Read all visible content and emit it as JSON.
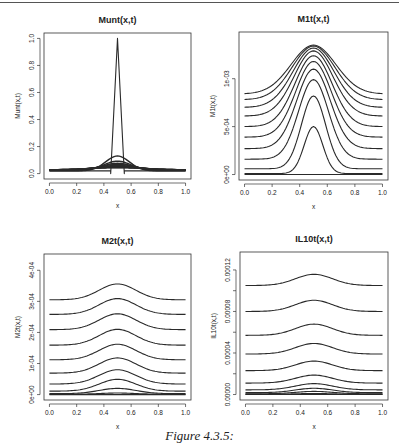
{
  "figure": {
    "caption": "Figure 4.3.5:"
  },
  "chart_data": [
    {
      "type": "line",
      "id": "munt",
      "title": "Munt(x,t)",
      "xlabel": "x",
      "ylabel": "Munt(x,t)",
      "xlim": [
        0,
        1
      ],
      "ylim": [
        0,
        1.0
      ],
      "xticks": [
        "0.0",
        "0.2",
        "0.4",
        "0.6",
        "0.8",
        "1.0"
      ],
      "yticks": [
        {
          "value": 0.0,
          "label": "0.0"
        },
        {
          "value": 0.2,
          "label": "0.2"
        },
        {
          "value": 0.4,
          "label": "0.4"
        },
        {
          "value": 0.6,
          "label": "0.6"
        },
        {
          "value": 0.8,
          "label": "0.8"
        },
        {
          "value": 1.0,
          "label": "1.0"
        }
      ],
      "grid": false,
      "initial_condition": {
        "shape": "spike",
        "peak_x": 0.5,
        "peak_y": 1.0,
        "support": [
          0.45,
          0.55
        ],
        "base": 0.02
      },
      "series": [
        {
          "name": "t1",
          "baseline": 0.02,
          "amplitude": 0.11,
          "width": 0.13
        },
        {
          "name": "t2",
          "baseline": 0.022,
          "amplitude": 0.07,
          "width": 0.15
        },
        {
          "name": "t3",
          "baseline": 0.024,
          "amplitude": 0.052,
          "width": 0.17
        },
        {
          "name": "t4",
          "baseline": 0.025,
          "amplitude": 0.042,
          "width": 0.19
        },
        {
          "name": "t5",
          "baseline": 0.026,
          "amplitude": 0.034,
          "width": 0.21
        },
        {
          "name": "t6",
          "baseline": 0.027,
          "amplitude": 0.028,
          "width": 0.23
        },
        {
          "name": "t7",
          "baseline": 0.027,
          "amplitude": 0.024,
          "width": 0.25
        },
        {
          "name": "t8",
          "baseline": 0.028,
          "amplitude": 0.02,
          "width": 0.27
        },
        {
          "name": "t9",
          "baseline": 0.028,
          "amplitude": 0.017,
          "width": 0.29
        },
        {
          "name": "t10",
          "baseline": 0.028,
          "amplitude": 0.015,
          "width": 0.31
        }
      ]
    },
    {
      "type": "line",
      "id": "m1t",
      "title": "M1t(x,t)",
      "xlabel": "x",
      "ylabel": "M1t(x,t)",
      "xlim": [
        0,
        1
      ],
      "ylim": [
        0,
        0.00143
      ],
      "xticks": [
        "0.0",
        "0.2",
        "0.4",
        "0.6",
        "0.8",
        "1.0"
      ],
      "yticks": [
        {
          "value": 0.0,
          "label": "0e+00"
        },
        {
          "value": 0.0005,
          "label": "5e-04"
        },
        {
          "value": 0.001,
          "label": "1e-03"
        }
      ],
      "grid": false,
      "series": [
        {
          "name": "t0",
          "baseline": 0.0,
          "amplitude": 0.0,
          "width": 0.2
        },
        {
          "name": "t1",
          "baseline": 1e-05,
          "amplitude": 0.00049,
          "width": 0.1
        },
        {
          "name": "t2",
          "baseline": 6e-05,
          "amplitude": 0.00076,
          "width": 0.13
        },
        {
          "name": "t3",
          "baseline": 0.00016,
          "amplitude": 0.00083,
          "width": 0.16
        },
        {
          "name": "t4",
          "baseline": 0.00027,
          "amplitude": 0.00083,
          "width": 0.18
        },
        {
          "name": "t5",
          "baseline": 0.00039,
          "amplitude": 0.00079,
          "width": 0.19
        },
        {
          "name": "t6",
          "baseline": 0.0005,
          "amplitude": 0.00074,
          "width": 0.2
        },
        {
          "name": "t7",
          "baseline": 0.00061,
          "amplitude": 0.00068,
          "width": 0.21
        },
        {
          "name": "t8",
          "baseline": 0.0007,
          "amplitude": 0.00062,
          "width": 0.22
        },
        {
          "name": "t9",
          "baseline": 0.00078,
          "amplitude": 0.00056,
          "width": 0.23
        },
        {
          "name": "t10",
          "baseline": 0.00084,
          "amplitude": 0.00051,
          "width": 0.24
        }
      ]
    },
    {
      "type": "line",
      "id": "m2t",
      "title": "M2t(x,t)",
      "xlabel": "x",
      "ylabel": "M2t(x,t)",
      "xlim": [
        0,
        1
      ],
      "ylim": [
        0,
        0.000435
      ],
      "xticks": [
        "0.0",
        "0.2",
        "0.4",
        "0.6",
        "0.8",
        "1.0"
      ],
      "yticks": [
        {
          "value": 0.0,
          "label": "0e+00"
        },
        {
          "value": 0.0001,
          "label": "1e-04"
        },
        {
          "value": 0.0002,
          "label": "2e-04"
        },
        {
          "value": 0.0003,
          "label": "3e-04"
        },
        {
          "value": 0.0004,
          "label": "4e-04"
        }
      ],
      "grid": false,
      "series": [
        {
          "name": "t0",
          "baseline": 0.0,
          "amplitude": 0.0,
          "width": 0.2
        },
        {
          "name": "t1",
          "baseline": 1e-06,
          "amplitude": 4e-06,
          "width": 0.2
        },
        {
          "name": "t2",
          "baseline": 3e-06,
          "amplitude": 1.7e-05,
          "width": 0.2
        },
        {
          "name": "t3",
          "baseline": 1.1e-05,
          "amplitude": 3.8e-05,
          "width": 0.2
        },
        {
          "name": "t4",
          "baseline": 3.4e-05,
          "amplitude": 4.6e-05,
          "width": 0.2
        },
        {
          "name": "t5",
          "baseline": 6.9e-05,
          "amplitude": 4.9e-05,
          "width": 0.2
        },
        {
          "name": "t6",
          "baseline": 0.000112,
          "amplitude": 5e-05,
          "width": 0.2
        },
        {
          "name": "t7",
          "baseline": 0.000159,
          "amplitude": 5.1e-05,
          "width": 0.2
        },
        {
          "name": "t8",
          "baseline": 0.000209,
          "amplitude": 5.1e-05,
          "width": 0.2
        },
        {
          "name": "t9",
          "baseline": 0.000258,
          "amplitude": 5.1e-05,
          "width": 0.2
        },
        {
          "name": "t10",
          "baseline": 0.000305,
          "amplitude": 5.1e-05,
          "width": 0.2
        }
      ]
    },
    {
      "type": "line",
      "id": "il10t",
      "title": "IL10t(x,t)",
      "xlabel": "x",
      "ylabel": "IL10t(x,t)",
      "xlim": [
        0,
        1
      ],
      "ylim": [
        0,
        0.000132
      ],
      "xticks": [
        "0.0",
        "0.2",
        "0.4",
        "0.6",
        "0.8",
        "1.0"
      ],
      "yticks": [
        {
          "value": 0.0,
          "label": "0.00000"
        },
        {
          "value": 2e-05,
          "label": ""
        },
        {
          "value": 4e-05,
          "label": "0.00004"
        },
        {
          "value": 6e-05,
          "label": ""
        },
        {
          "value": 8e-05,
          "label": "0.00008"
        },
        {
          "value": 0.0001,
          "label": ""
        },
        {
          "value": 0.00012,
          "label": "0.00012"
        }
      ],
      "grid": false,
      "series": [
        {
          "name": "t0",
          "baseline": 0.0,
          "amplitude": 0.0,
          "width": 0.2
        },
        {
          "name": "t1",
          "baseline": 2e-07,
          "amplitude": 8e-07,
          "width": 0.2
        },
        {
          "name": "t2",
          "baseline": 7e-07,
          "amplitude": 2.3e-06,
          "width": 0.2
        },
        {
          "name": "t3",
          "baseline": 1.8e-06,
          "amplitude": 4.2e-06,
          "width": 0.2
        },
        {
          "name": "t4",
          "baseline": 4.5e-06,
          "amplitude": 6e-06,
          "width": 0.2
        },
        {
          "name": "t5",
          "baseline": 1.1e-05,
          "amplitude": 7.7e-06,
          "width": 0.2
        },
        {
          "name": "t6",
          "baseline": 2.3e-05,
          "amplitude": 9.2e-06,
          "width": 0.2
        },
        {
          "name": "t7",
          "baseline": 3.9e-05,
          "amplitude": 1.02e-05,
          "width": 0.2
        },
        {
          "name": "t8",
          "baseline": 5.7e-05,
          "amplitude": 1.08e-05,
          "width": 0.2
        },
        {
          "name": "t9",
          "baseline": 8e-05,
          "amplitude": 1.08e-05,
          "width": 0.2
        },
        {
          "name": "t10",
          "baseline": 0.000105,
          "amplitude": 1.08e-05,
          "width": 0.2
        }
      ]
    }
  ],
  "panels": {
    "munt": {
      "title": "Munt(x,t)",
      "xlabel": "x",
      "ylabel": "Munt(x,t)"
    },
    "m1t": {
      "title": "M1t(x,t)",
      "xlabel": "x",
      "ylabel": "M1t(x,t)"
    },
    "m2t": {
      "title": "M2t(x,t)",
      "xlabel": "x",
      "ylabel": "M2t(x,t)"
    },
    "il10t": {
      "title": "IL10t(x,t)",
      "xlabel": "x",
      "ylabel": "IL10t(x,t)"
    }
  }
}
